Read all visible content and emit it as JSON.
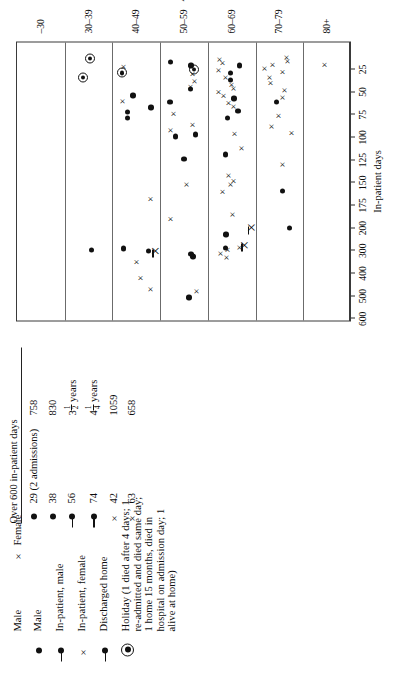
{
  "figure": {
    "orientation": "rotated-90-ccw"
  },
  "legend": {
    "header": {
      "male": "Male",
      "female_symbol": "×",
      "female": "Female"
    },
    "items": [
      {
        "symbol": "male-dot",
        "label": "Male"
      },
      {
        "symbol": "male-dot-with-tail",
        "label": "In-patient, male"
      },
      {
        "symbol": "female-cross-with-tail",
        "label": "In-patient,  female"
      },
      {
        "symbol": "male-dot-with-tail",
        "label": "Discharged home"
      },
      {
        "symbol": "circled-dot",
        "label": "Holiday (1 died after 4 days; 1 re-admitted and died same day; 1 home 15 months, died in hospital on admission day; 1 alive at home)"
      }
    ]
  },
  "over600": {
    "title": "Over 600 in-patient days",
    "rows": [
      {
        "symbol": "male-dot",
        "age": "29 (2 admissions)",
        "days": "758"
      },
      {
        "symbol": "male-dot",
        "age": "38",
        "days": "830"
      },
      {
        "symbol": "male-dot-with-tail",
        "age": "56",
        "days": "3½ years",
        "frac": {
          "whole": "3",
          "num": "1",
          "den": "2",
          "unit": "years"
        }
      },
      {
        "symbol": "male-dot-with-tail",
        "age": "74",
        "days": "4¼ years",
        "frac": {
          "whole": "4",
          "num": "1",
          "den": "4",
          "unit": "years"
        }
      },
      {
        "symbol": "female-cross",
        "age": "42",
        "days": "1059"
      },
      {
        "symbol": "female-cross",
        "age": "63",
        "days": "658"
      }
    ]
  },
  "chart_data": {
    "type": "scatter",
    "title": "",
    "xlabel": "In-patient days",
    "ylabel": "Age groups",
    "x_ticks": [
      "600",
      "500",
      "400",
      "300",
      "200",
      "175",
      "150",
      "125",
      "100",
      "75",
      "50",
      "25"
    ],
    "x_tick_positions": [
      600,
      500,
      400,
      300,
      200,
      175,
      150,
      125,
      100,
      75,
      50,
      25
    ],
    "x_reversed": true,
    "grid": "horizontal band separators only",
    "legend_position": "left of plot (separate block)",
    "categories": [
      "–30",
      "30–39",
      "40–49",
      "50–59",
      "60–69",
      "70–79",
      "80+"
    ],
    "series": [
      {
        "name": "Male",
        "symbol": "filled-circle"
      },
      {
        "name": "Female",
        "symbol": "cross"
      },
      {
        "name": "In-patient, male",
        "symbol": "filled-circle-with-tail"
      },
      {
        "name": "In-patient, female",
        "symbol": "cross-with-tail"
      },
      {
        "name": "Discharged home",
        "symbol": "filled-circle-with-tail"
      },
      {
        "name": "Holiday",
        "symbol": "circled-dot"
      }
    ],
    "points": [
      {
        "age": "30–39",
        "days": 300,
        "type": "male"
      },
      {
        "age": "30–39",
        "days": 35,
        "type": "holiday"
      },
      {
        "age": "30–39",
        "days": 14,
        "type": "holiday"
      },
      {
        "age": "40–49",
        "days": 470,
        "type": "female"
      },
      {
        "age": "40–49",
        "days": 420,
        "type": "female"
      },
      {
        "age": "40–49",
        "days": 350,
        "type": "female"
      },
      {
        "age": "40–49",
        "days": 325,
        "type": "femaleIn"
      },
      {
        "age": "40–49",
        "days": 305,
        "type": "male"
      },
      {
        "age": "40–49",
        "days": 295,
        "type": "male"
      },
      {
        "age": "40–49",
        "days": 168,
        "type": "female"
      },
      {
        "age": "40–49",
        "days": 80,
        "type": "male"
      },
      {
        "age": "40–49",
        "days": 73,
        "type": "male"
      },
      {
        "age": "40–49",
        "days": 68,
        "type": "male"
      },
      {
        "age": "40–49",
        "days": 60,
        "type": "female"
      },
      {
        "age": "40–49",
        "days": 55,
        "type": "male"
      },
      {
        "age": "40–49",
        "days": 30,
        "type": "holiday"
      },
      {
        "age": "40–49",
        "days": 22,
        "type": "female"
      },
      {
        "age": "50–59",
        "days": 510,
        "type": "male"
      },
      {
        "age": "50–59",
        "days": 478,
        "type": "female"
      },
      {
        "age": "50–59",
        "days": 330,
        "type": "male"
      },
      {
        "age": "50–59",
        "days": 318,
        "type": "male"
      },
      {
        "age": "50–59",
        "days": 190,
        "type": "female"
      },
      {
        "age": "50–59",
        "days": 152,
        "type": "female"
      },
      {
        "age": "50–59",
        "days": 125,
        "type": "male"
      },
      {
        "age": "50–59",
        "days": 100,
        "type": "male"
      },
      {
        "age": "50–59",
        "days": 98,
        "type": "male"
      },
      {
        "age": "50–59",
        "days": 92,
        "type": "female"
      },
      {
        "age": "50–59",
        "days": 86,
        "type": "female"
      },
      {
        "age": "50–59",
        "days": 74,
        "type": "female"
      },
      {
        "age": "50–59",
        "days": 62,
        "type": "male"
      },
      {
        "age": "50–59",
        "days": 48,
        "type": "male"
      },
      {
        "age": "50–59",
        "days": 44,
        "type": "female"
      },
      {
        "age": "50–59",
        "days": 38,
        "type": "female"
      },
      {
        "age": "50–59",
        "days": 30,
        "type": "female"
      },
      {
        "age": "50–59",
        "days": 26,
        "type": "holiday"
      },
      {
        "age": "50–59",
        "days": 22,
        "type": "male"
      },
      {
        "age": "50–59",
        "days": 18,
        "type": "male"
      },
      {
        "age": "60–69",
        "days": 330,
        "type": "female"
      },
      {
        "age": "60–69",
        "days": 312,
        "type": "female"
      },
      {
        "age": "60–69",
        "days": 300,
        "type": "femaleIn"
      },
      {
        "age": "60–69",
        "days": 296,
        "type": "female"
      },
      {
        "age": "60–69",
        "days": 292,
        "type": "male"
      },
      {
        "age": "60–69",
        "days": 286,
        "type": "female"
      },
      {
        "age": "60–69",
        "days": 232,
        "type": "male"
      },
      {
        "age": "60–69",
        "days": 222,
        "type": "femaleIn"
      },
      {
        "age": "60–69",
        "days": 185,
        "type": "female"
      },
      {
        "age": "60–69",
        "days": 160,
        "type": "female"
      },
      {
        "age": "60–69",
        "days": 152,
        "type": "female"
      },
      {
        "age": "60–69",
        "days": 148,
        "type": "female"
      },
      {
        "age": "60–69",
        "days": 142,
        "type": "female"
      },
      {
        "age": "60–69",
        "days": 120,
        "type": "male"
      },
      {
        "age": "60–69",
        "days": 112,
        "type": "female"
      },
      {
        "age": "60–69",
        "days": 96,
        "type": "female"
      },
      {
        "age": "60–69",
        "days": 80,
        "type": "male"
      },
      {
        "age": "60–69",
        "days": 72,
        "type": "male"
      },
      {
        "age": "60–69",
        "days": 66,
        "type": "female"
      },
      {
        "age": "60–69",
        "days": 62,
        "type": "female"
      },
      {
        "age": "60–69",
        "days": 58,
        "type": "male"
      },
      {
        "age": "60–69",
        "days": 54,
        "type": "female"
      },
      {
        "age": "60–69",
        "days": 50,
        "type": "female"
      },
      {
        "age": "60–69",
        "days": 46,
        "type": "female"
      },
      {
        "age": "60–69",
        "days": 42,
        "type": "female"
      },
      {
        "age": "60–69",
        "days": 38,
        "type": "male"
      },
      {
        "age": "60–69",
        "days": 34,
        "type": "female"
      },
      {
        "age": "60–69",
        "days": 30,
        "type": "male"
      },
      {
        "age": "60–69",
        "days": 26,
        "type": "female"
      },
      {
        "age": "60–69",
        "days": 22,
        "type": "male"
      },
      {
        "age": "60–69",
        "days": 18,
        "type": "female"
      },
      {
        "age": "60–69",
        "days": 14,
        "type": "female"
      },
      {
        "age": "70–79",
        "days": 205,
        "type": "male"
      },
      {
        "age": "70–79",
        "days": 160,
        "type": "male"
      },
      {
        "age": "70–79",
        "days": 130,
        "type": "female"
      },
      {
        "age": "70–79",
        "days": 95,
        "type": "female"
      },
      {
        "age": "70–79",
        "days": 88,
        "type": "female"
      },
      {
        "age": "70–79",
        "days": 76,
        "type": "female"
      },
      {
        "age": "70–79",
        "days": 62,
        "type": "male"
      },
      {
        "age": "70–79",
        "days": 56,
        "type": "female"
      },
      {
        "age": "70–79",
        "days": 48,
        "type": "female"
      },
      {
        "age": "70–79",
        "days": 40,
        "type": "female"
      },
      {
        "age": "70–79",
        "days": 34,
        "type": "female"
      },
      {
        "age": "70–79",
        "days": 28,
        "type": "female"
      },
      {
        "age": "70–79",
        "days": 24,
        "type": "female"
      },
      {
        "age": "70–79",
        "days": 20,
        "type": "female"
      },
      {
        "age": "70–79",
        "days": 16,
        "type": "female"
      },
      {
        "age": "70–79",
        "days": 12,
        "type": "female"
      },
      {
        "age": "80+",
        "days": 20,
        "type": "female"
      }
    ]
  }
}
